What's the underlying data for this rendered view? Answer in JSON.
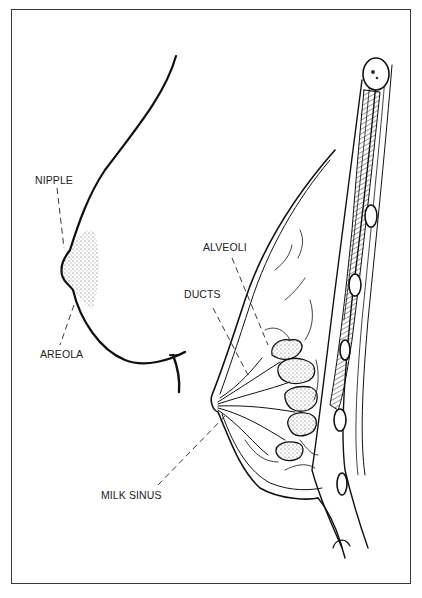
{
  "figure": {
    "labels": {
      "nipple": "NIPPLE",
      "areola": "AREOLA",
      "alveoli": "ALVEOLI",
      "ducts": "DUCTS",
      "milk_sinus": "MILK SINUS"
    },
    "panels": [
      {
        "name": "external-view",
        "parts": [
          "nipple",
          "areola"
        ]
      },
      {
        "name": "cross-section",
        "parts": [
          "alveoli",
          "ducts",
          "milk_sinus"
        ]
      }
    ],
    "caption": "",
    "colors": {
      "ink": "#111111",
      "frame": "#3a3a3a",
      "background": "#ffffff"
    }
  }
}
